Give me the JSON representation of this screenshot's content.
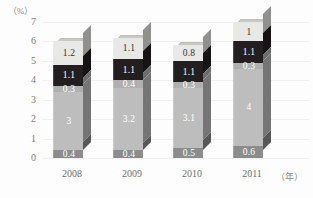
{
  "chart_data": {
    "type": "bar",
    "subtype": "stacked-column-3d",
    "title": "",
    "xlabel": "(年)",
    "ylabel": "(%)",
    "categories": [
      "2008",
      "2009",
      "2010",
      "2011"
    ],
    "ylim": [
      0,
      7
    ],
    "yticks": [
      "7",
      "6",
      "5",
      "4",
      "3",
      "2",
      "1",
      "0"
    ],
    "grid": true,
    "legend": "none",
    "series": [
      {
        "name": "segment-1-bottom",
        "values": [
          0.4,
          0.4,
          0.5,
          0.6
        ],
        "labels": [
          "0.4",
          "0.4",
          "0.5",
          "0.6"
        ],
        "color": "#8c8c8c",
        "text_color": "#ffffff"
      },
      {
        "name": "segment-2",
        "values": [
          3,
          3.2,
          3.1,
          4
        ],
        "labels": [
          "3",
          "3.2",
          "3.1",
          "4"
        ],
        "color": "#bdbdbd",
        "text_color": "#ffffff"
      },
      {
        "name": "segment-3",
        "values": [
          0.3,
          0.4,
          0.3,
          0.3
        ],
        "labels": [
          "0.3",
          "0.4",
          "0.3",
          "0.3"
        ],
        "color": "#b0b0b0",
        "text_color": "#ffffff"
      },
      {
        "name": "segment-4",
        "values": [
          1.1,
          1.1,
          1.1,
          1.1
        ],
        "labels": [
          "1.1",
          "1.1",
          "1.1",
          "1.1"
        ],
        "color": "#231f20",
        "text_color": "#ffffff"
      },
      {
        "name": "segment-5-top",
        "values": [
          1.2,
          1.1,
          0.8,
          1
        ],
        "labels": [
          "1.2",
          "1.1",
          "0.8",
          "1"
        ],
        "color": "#e8e8e6",
        "text_color": "#333333"
      }
    ],
    "totals": [
      6.0,
      6.2,
      6.0,
      7.0
    ]
  },
  "axis": {
    "y_unit": "（%）",
    "x_unit": "（年）"
  },
  "colors": {
    "background": "#fdfdfd",
    "gridline": "#f0f0ee",
    "tick_text": "#7d7d7d"
  }
}
